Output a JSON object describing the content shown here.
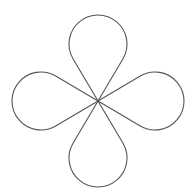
{
  "figure": {
    "title": "Four-petal teardrop rosette",
    "background": "#ffffff",
    "stroke_color": "#555555",
    "center": [
      98,
      101
    ],
    "petal_radius": 29,
    "petals": [
      {
        "name": "top",
        "path": "M98,101 L73,58.7 A29,29 0 1,1 123,58.7 Z"
      },
      {
        "name": "right",
        "path": "M98,101 L140.3,76 A29,29 0 1,1 140.3,126 Z"
      },
      {
        "name": "bottom",
        "path": "M98,101 L123,143.3 A29,29 0 1,1 73,143.3 Z"
      },
      {
        "name": "left",
        "path": "M98,101 L55.7,126 A29,29 0 1,1 55.7,76 Z"
      }
    ]
  }
}
